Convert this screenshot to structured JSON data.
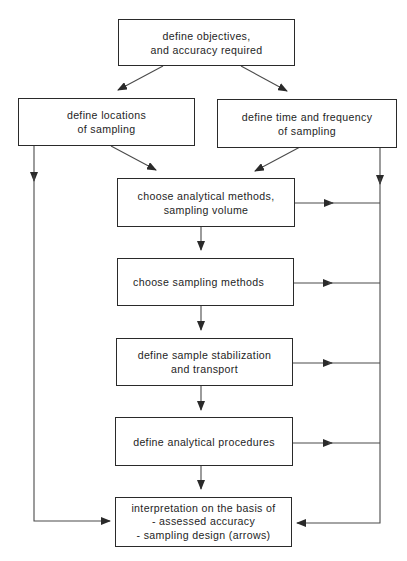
{
  "diagram": {
    "type": "flowchart",
    "colors": {
      "line": "#4a4a4a",
      "border": "#2a2a2a",
      "text": "#1e1e1e",
      "background": "#ffffff"
    },
    "nodes": {
      "objectives": {
        "lines": [
          "define objectives,",
          "and accuracy required"
        ]
      },
      "locations": {
        "lines": [
          "define locations",
          "of sampling"
        ]
      },
      "time_frequency": {
        "lines": [
          "define time and frequency",
          "of sampling"
        ]
      },
      "analytical_methods": {
        "lines": [
          "choose analytical methods,",
          "sampling volume"
        ]
      },
      "sampling_methods": {
        "lines": [
          "choose sampling methods"
        ]
      },
      "stabilization": {
        "lines": [
          "define sample stabilization",
          "and transport"
        ]
      },
      "analytical_procedures": {
        "lines": [
          "define analytical procedures"
        ]
      },
      "interpretation": {
        "lines": [
          "interpretation on the basis of",
          "- assessed accuracy",
          "- sampling design (arrows)"
        ]
      }
    },
    "edges": [
      {
        "from": "objectives",
        "to": "locations"
      },
      {
        "from": "objectives",
        "to": "time_frequency"
      },
      {
        "from": "locations",
        "to": "analytical_methods"
      },
      {
        "from": "time_frequency",
        "to": "analytical_methods"
      },
      {
        "from": "locations",
        "to": "interpretation",
        "via": "left-bus"
      },
      {
        "from": "time_frequency",
        "to": "interpretation",
        "via": "right-bus"
      },
      {
        "from": "analytical_methods",
        "to": "sampling_methods"
      },
      {
        "from": "sampling_methods",
        "to": "stabilization"
      },
      {
        "from": "stabilization",
        "to": "analytical_procedures"
      },
      {
        "from": "analytical_procedures",
        "to": "interpretation"
      },
      {
        "from": "analytical_methods",
        "to": "right-bus"
      },
      {
        "from": "sampling_methods",
        "to": "right-bus"
      },
      {
        "from": "stabilization",
        "to": "right-bus"
      },
      {
        "from": "analytical_procedures",
        "to": "right-bus"
      }
    ]
  }
}
